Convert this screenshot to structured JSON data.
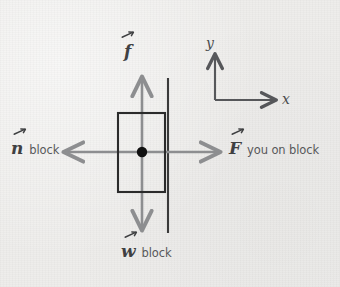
{
  "figure": {
    "background_color": "#eeedeb",
    "width": 340,
    "height": 287
  },
  "colors": {
    "background": "#eeedeb",
    "block_outline": "#2b2b2b",
    "wall_line": "#3a3a3a",
    "center_dot": "#111111",
    "force_arrow": "#8d8e90",
    "axis": "#56575a",
    "label_main": "#3f4042",
    "label_sub": "#57585a"
  },
  "block": {
    "name": "block",
    "x": 118,
    "y": 113,
    "width": 47,
    "height": 79,
    "center_dot_label": "center-of-mass-dot"
  },
  "wall": {
    "name": "wall",
    "x": 168,
    "y_top": 78,
    "y_bottom": 233
  },
  "forces": [
    {
      "id": "friction",
      "symbol": "f",
      "subscript": "",
      "direction": "up",
      "label_text": "f",
      "vector_notation": true,
      "tail": [
        142,
        152
      ],
      "head": [
        142,
        75
      ],
      "color": "#8d8e90"
    },
    {
      "id": "normal",
      "symbol": "n",
      "subscript": "block",
      "direction": "left",
      "label_text": "n",
      "vector_notation": true,
      "tail": [
        142,
        152
      ],
      "head": [
        62,
        152
      ],
      "color": "#8d8e90"
    },
    {
      "id": "applied",
      "symbol": "F",
      "subscript": "you on block",
      "direction": "right",
      "label_text": "F",
      "vector_notation": true,
      "tail": [
        142,
        152
      ],
      "head": [
        222,
        152
      ],
      "color": "#8d8e90"
    },
    {
      "id": "weight",
      "symbol": "w",
      "subscript": "block",
      "direction": "down",
      "label_text": "w",
      "vector_notation": true,
      "tail": [
        142,
        152
      ],
      "head": [
        142,
        232
      ],
      "color": "#8d8e90"
    }
  ],
  "axes": {
    "name": "coordinate-axes",
    "origin": [
      215,
      100
    ],
    "y_axis": {
      "label": "y",
      "tip": [
        215,
        52
      ]
    },
    "x_axis": {
      "label": "x",
      "tip": [
        278,
        100
      ]
    },
    "color": "#56575a"
  }
}
